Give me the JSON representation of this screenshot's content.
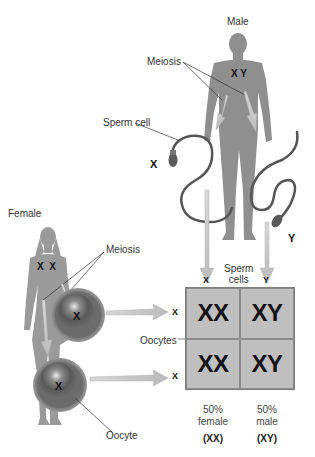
{
  "male": {
    "label": "Male",
    "chromosomes": "X Y",
    "meiosis_label": "Meiosis",
    "sperm_label": "Sperm cell",
    "sperm": [
      {
        "chromosome": "X"
      },
      {
        "chromosome": "Y"
      }
    ]
  },
  "female": {
    "label": "Female",
    "chromosomes": "X  X",
    "meiosis_label": "Meiosis",
    "oocyte_label": "Oocyte",
    "oocytes": [
      {
        "chromosome": "X"
      },
      {
        "chromosome": "X"
      }
    ]
  },
  "punnett": {
    "column_header": "Sperm\ncells",
    "column_header_line1": "Sperm",
    "column_header_line2": "cells",
    "columns": [
      "X",
      "Y"
    ],
    "row_header": "Oocytes",
    "rows": [
      "X",
      "X"
    ],
    "cells": [
      [
        "XX",
        "XY"
      ],
      [
        "XX",
        "XY"
      ]
    ]
  },
  "results": [
    {
      "percent": "50%",
      "sex": "female",
      "genotype": "(XX)"
    },
    {
      "percent": "50%",
      "sex": "male",
      "genotype": "(XY)"
    }
  ],
  "colors": {
    "silhouette": "#8f8f8f",
    "arrow": "#c8c8c8",
    "cell_fill": "#bfbfbf",
    "oocyte_outer": "#7a7a7a",
    "oocyte_inner": "#5a5a5a",
    "sperm": "#555555"
  }
}
